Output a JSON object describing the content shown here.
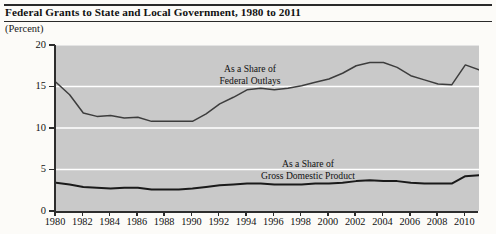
{
  "header": {
    "title": "Federal Grants to State and Local Government, 1980 to 2011",
    "unit_label": "(Percent)"
  },
  "annotations": {
    "federal_outlays": {
      "line1": "As a Share of",
      "line2": "Federal Outlays"
    },
    "gdp": {
      "line1": "As a Share of",
      "line2": "Gross Domestic Product"
    }
  },
  "colors": {
    "plot_background": "#c9c9c9",
    "gridline": "#ffffff",
    "axis": "#2d2d2d",
    "series_federal_outlays": "#3d3d3d",
    "series_gdp": "#1a1a1a",
    "page_background": "#fcfbf8",
    "text": "#111111"
  },
  "chart_data": {
    "type": "line",
    "title": "Federal Grants to State and Local Government, 1980 to 2011",
    "xlabel": "",
    "ylabel": "(Percent)",
    "xlim": [
      1980,
      2011
    ],
    "ylim": [
      0,
      20
    ],
    "yticks": [
      0,
      5,
      10,
      15,
      20
    ],
    "ytick_labels": [
      "0",
      "5",
      "10",
      "15",
      "20"
    ],
    "xticks": [
      1980,
      1982,
      1984,
      1986,
      1988,
      1990,
      1992,
      1994,
      1996,
      1998,
      2000,
      2002,
      2004,
      2006,
      2008,
      2010
    ],
    "xtick_labels": [
      "1980",
      "1982",
      "1984",
      "1986",
      "1988",
      "1990",
      "1992",
      "1994",
      "1996",
      "1998",
      "2000",
      "2002",
      "2004",
      "2006",
      "2008",
      "2010"
    ],
    "grid": "horizontal",
    "legend": "inline-annotation",
    "x": [
      1980,
      1981,
      1982,
      1983,
      1984,
      1985,
      1986,
      1987,
      1988,
      1989,
      1990,
      1991,
      1992,
      1993,
      1994,
      1995,
      1996,
      1997,
      1998,
      1999,
      2000,
      2001,
      2002,
      2003,
      2004,
      2005,
      2006,
      2007,
      2008,
      2009,
      2010,
      2011
    ],
    "series": [
      {
        "name": "As a Share of Federal Outlays",
        "values": [
          15.5,
          14.0,
          11.8,
          11.4,
          11.5,
          11.2,
          11.3,
          10.8,
          10.8,
          10.8,
          10.8,
          11.7,
          12.9,
          13.7,
          14.6,
          14.8,
          14.6,
          14.8,
          15.1,
          15.5,
          15.9,
          16.6,
          17.5,
          17.9,
          17.9,
          17.3,
          16.3,
          15.8,
          15.3,
          15.2,
          17.6,
          17.0
        ]
      },
      {
        "name": "As a Share of Gross Domestic Product",
        "values": [
          3.4,
          3.2,
          2.9,
          2.8,
          2.7,
          2.8,
          2.8,
          2.6,
          2.6,
          2.6,
          2.7,
          2.9,
          3.1,
          3.2,
          3.3,
          3.3,
          3.2,
          3.2,
          3.2,
          3.3,
          3.3,
          3.4,
          3.6,
          3.7,
          3.6,
          3.6,
          3.4,
          3.3,
          3.3,
          3.3,
          4.2,
          4.3
        ]
      }
    ]
  }
}
